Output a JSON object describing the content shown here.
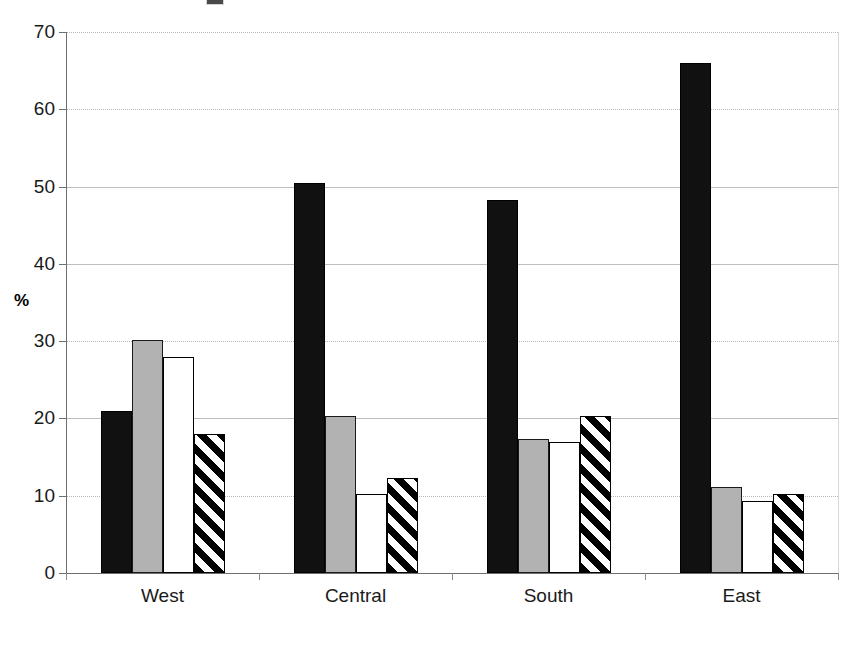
{
  "chart_data": {
    "type": "bar",
    "title": "",
    "subtitle": "",
    "xlabel": "",
    "ylabel": "%",
    "categories": [
      "West",
      "Central",
      "South",
      "East"
    ],
    "series": [
      {
        "name": "Series 1",
        "style": "solid-black",
        "color": "#111111",
        "values": [
          21.0,
          50.5,
          48.2,
          66.0
        ]
      },
      {
        "name": "Series 2",
        "style": "gray",
        "color": "#b2b2b2",
        "values": [
          30.2,
          20.3,
          17.3,
          11.1
        ]
      },
      {
        "name": "Series 3",
        "style": "white",
        "color": "#ffffff",
        "values": [
          28.0,
          10.2,
          16.9,
          9.3
        ]
      },
      {
        "name": "Series 4",
        "style": "hatch",
        "color": "#000000",
        "values": [
          18.0,
          12.3,
          20.3,
          10.2
        ]
      }
    ],
    "ylim": [
      0,
      70
    ],
    "yticks": [
      0,
      10,
      20,
      30,
      40,
      50,
      60,
      70
    ],
    "ytick_labels": [
      "0",
      "10",
      "20",
      "30",
      "40",
      "50",
      "60",
      "70"
    ],
    "grid": true,
    "grid_axis": "y",
    "legend": "none",
    "legend_position": "none",
    "annotations": []
  },
  "axis": {
    "y_title": "%"
  }
}
